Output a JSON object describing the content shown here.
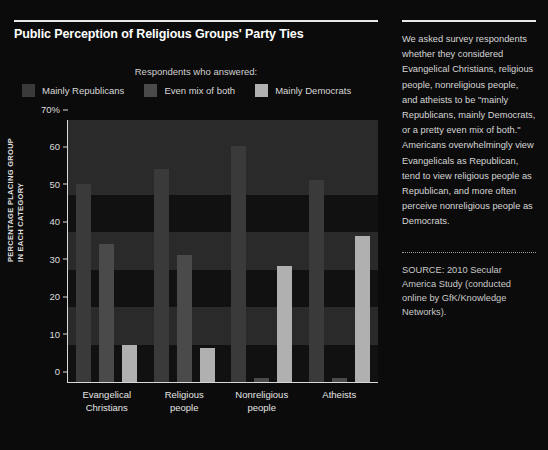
{
  "chart_title": "Public Perception of Religious Groups' Party Ties",
  "legend": {
    "heading": "Respondents who answered:",
    "items": [
      {
        "label": "Mainly Republicans",
        "color": "#3a3a3a"
      },
      {
        "label": "Even mix of both",
        "color": "#4a4a4a"
      },
      {
        "label": "Mainly Democrats",
        "color": "#b0b0b0"
      }
    ]
  },
  "axis": {
    "ylabel_line1": "PERCENTAGE PLACING GROUP",
    "ylabel_line2": "IN EACH CATEGORY",
    "yticks": [
      "70%",
      "60",
      "50",
      "40",
      "30",
      "20",
      "10",
      "0"
    ],
    "ymin": 0,
    "ymax": 70
  },
  "sidebar": {
    "blurb": "We asked survey respondents whether they considered Evangelical Christians, religious people, nonreligious people, and atheists to be \"mainly Republicans, mainly Democrats, or a pretty even mix of both.\" Americans overwhelmingly view Evangelicals as Republican, tend to view religious people as Republican, and more often perceive nonreligious people as Democrats.",
    "source": "SOURCE: 2010 Secular America Study (conducted online by GfK/Knowledge Networks)."
  },
  "chart_data": {
    "type": "bar",
    "title": "Public Perception of Religious Groups' Party Ties",
    "xlabel": "",
    "ylabel": "PERCENTAGE PLACING GROUP IN EACH CATEGORY",
    "ylim": [
      0,
      70
    ],
    "grid": false,
    "legend_position": "top",
    "categories": [
      "Evangelical Christians",
      "Religious people",
      "Nonreligious people",
      "Atheists"
    ],
    "category_lines": [
      [
        "Evangelical",
        "Christians"
      ],
      [
        "Religious",
        "people"
      ],
      [
        "Nonreligious",
        "people"
      ],
      [
        "Atheists",
        ""
      ]
    ],
    "series": [
      {
        "name": "Mainly Republicans",
        "color": "#3a3a3a",
        "values": [
          53,
          57,
          63,
          54
        ]
      },
      {
        "name": "Even mix of both",
        "color": "#4a4a4a",
        "values": [
          37,
          34,
          1,
          1
        ]
      },
      {
        "name": "Mainly Democrats",
        "color": "#b0b0b0",
        "values": [
          10,
          9,
          31,
          39
        ]
      }
    ]
  }
}
